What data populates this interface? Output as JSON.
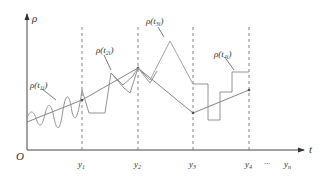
{
  "axes": {
    "y_label": "ρ",
    "x_label": "t",
    "origin_label": "O"
  },
  "ticks": [
    {
      "label": "y",
      "sub": "1",
      "x": 82
    },
    {
      "label": "y",
      "sub": "2",
      "x": 138
    },
    {
      "label": "y",
      "sub": "3",
      "x": 193
    },
    {
      "label": "y",
      "sub": "4",
      "x": 249
    },
    {
      "label": "y",
      "sub": "n",
      "x": 292
    }
  ],
  "ellipsis": "···",
  "curve_labels": [
    {
      "text": "ρ(t",
      "sub": "1i",
      "close": ")"
    },
    {
      "text": "ρ(t",
      "sub": "2i",
      "close": ")"
    },
    {
      "text": "ρ(t",
      "sub": "3i",
      "close": ")"
    },
    {
      "text": "ρ(t",
      "sub": "4i",
      "close": ")"
    }
  ],
  "colors": {
    "axis": "#444444",
    "curve": "#888888",
    "line": "#777777",
    "dashed": "#777777"
  }
}
